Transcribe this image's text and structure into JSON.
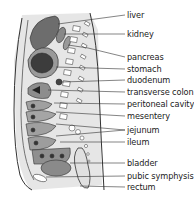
{
  "diagram": {
    "labels": [
      {
        "text": "liver",
        "y": 15
      },
      {
        "text": "kidney",
        "y": 34
      },
      {
        "text": "pancreas",
        "y": 57
      },
      {
        "text": "stomach",
        "y": 69
      },
      {
        "text": "duodenum",
        "y": 80
      },
      {
        "text": "transverse colon",
        "y": 92
      },
      {
        "text": "peritoneal cavity",
        "y": 104
      },
      {
        "text": "mesentery",
        "y": 116
      },
      {
        "text": "jejunum",
        "y": 130
      },
      {
        "text": "ileum",
        "y": 142
      },
      {
        "text": "bladder",
        "y": 163
      },
      {
        "text": "pubic symphysis",
        "y": 176
      },
      {
        "text": "rectum",
        "y": 187
      }
    ]
  }
}
